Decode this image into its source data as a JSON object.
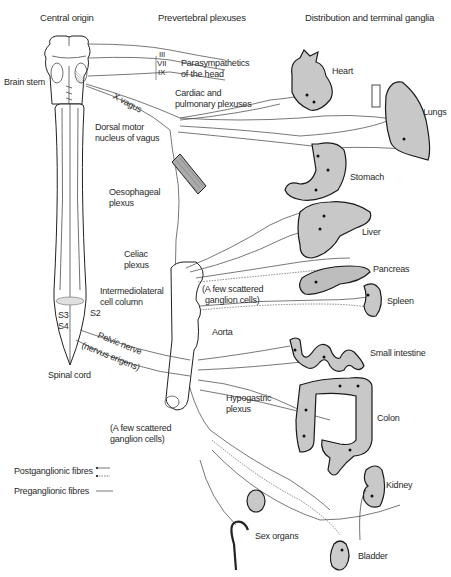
{
  "headers": {
    "central_origin": "Central origin",
    "prevertebral": "Prevertebral plexuses",
    "distribution": "Distribution and terminal ganglia"
  },
  "labels": {
    "brain_stem": "Brain stem",
    "cranial_nerves": [
      "III",
      "VII",
      "IX"
    ],
    "parasympathetics_1": "Parasympathetics",
    "parasympathetics_2": "of the head",
    "x_vagus": "X vagus",
    "cardiac_1": "Cardiac and",
    "cardiac_2": "pulmonary plexuses",
    "dorsal_1": "Dorsal motor",
    "dorsal_2": "nucleus of vagus",
    "oesophageal_1": "Oesophageal",
    "oesophageal_2": "plexus",
    "celiac_1": "Celiac",
    "celiac_2": "plexus",
    "scattered_1": "(A few scattered",
    "scattered_2": "ganglion cells)",
    "intermedio_1": "Intermediolateral",
    "intermedio_2": "cell column",
    "s2": "S2",
    "s3": "S3",
    "s4": "S4",
    "pelvic_1": "Pelvic nerve",
    "pelvic_2": "(nervus erigens)",
    "aorta": "Aorta",
    "spinal_cord": "Spinal cord",
    "hypogastric_1": "Hypogastric",
    "hypogastric_2": "plexus",
    "scattered_lower_1": "(A few scattered",
    "scattered_lower_2": "ganglion cells)"
  },
  "organs": {
    "heart": "Heart",
    "lungs": "Lungs",
    "stomach": "Stomach",
    "liver": "Liver",
    "pancreas": "Pancreas",
    "spleen": "Spleen",
    "small_intestine": "Small intestine",
    "colon": "Colon",
    "kidney": "Kidney",
    "sex_organs": "Sex organs",
    "bladder": "Bladder"
  },
  "legend": {
    "postganglionic": "Postganglionic fibres",
    "preganglionic": "Preganglionic fibres"
  },
  "colors": {
    "organ_fill": "#c8c8c8",
    "outline": "#1a1a1a",
    "nerve": "#555555"
  }
}
